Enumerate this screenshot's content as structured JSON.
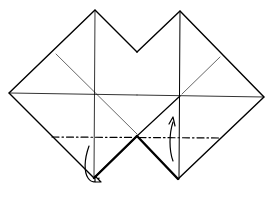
{
  "diagram": {
    "stroke_color": "#000000",
    "background": "#ffffff",
    "elements": [
      {
        "name": "left-square",
        "points": [
          [
            95,
            10
          ],
          [
            9,
            93
          ],
          [
            94,
            178
          ],
          [
            137,
            136
          ]
        ]
      },
      {
        "name": "right-square",
        "points": [
          [
            180,
            11
          ],
          [
            264,
            97
          ],
          [
            178,
            179
          ],
          [
            137,
            136
          ]
        ]
      },
      {
        "name": "fold-line",
        "style": "dashed",
        "from": [
          52,
          137
        ],
        "to": [
          221,
          138
        ]
      },
      {
        "name": "arrow-left",
        "direction": "behind"
      },
      {
        "name": "arrow-right",
        "direction": "up"
      }
    ]
  }
}
